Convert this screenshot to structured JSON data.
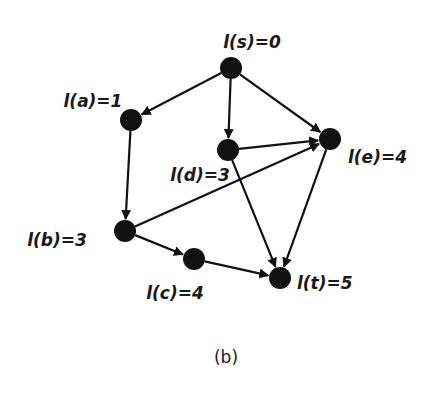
{
  "diagram": {
    "caption": "(b)",
    "nodes": [
      {
        "id": "s",
        "label": "l(s)=0"
      },
      {
        "id": "a",
        "label": "l(a)=1"
      },
      {
        "id": "d",
        "label": "l(d)=3"
      },
      {
        "id": "e",
        "label": "l(e)=4"
      },
      {
        "id": "b",
        "label": "l(b)=3"
      },
      {
        "id": "c",
        "label": "l(c)=4"
      },
      {
        "id": "t",
        "label": "l(t)=5"
      }
    ],
    "edges": [
      {
        "from": "s",
        "to": "a"
      },
      {
        "from": "s",
        "to": "d"
      },
      {
        "from": "s",
        "to": "e"
      },
      {
        "from": "a",
        "to": "b"
      },
      {
        "from": "d",
        "to": "e"
      },
      {
        "from": "d",
        "to": "t"
      },
      {
        "from": "b",
        "to": "e"
      },
      {
        "from": "b",
        "to": "c"
      },
      {
        "from": "c",
        "to": "t"
      },
      {
        "from": "e",
        "to": "t"
      }
    ]
  }
}
